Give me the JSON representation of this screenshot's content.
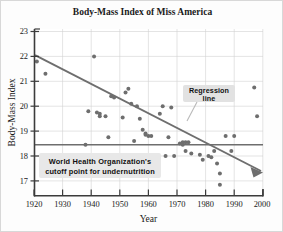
{
  "figure": {
    "title": "Body-Mass Index of Miss America",
    "border_color": "#d8d8d8",
    "background": "#fdfdfd"
  },
  "axes": {
    "x_label": "Year",
    "y_label": "Body-Mass Index",
    "x_ticks": [
      "1920",
      "1930",
      "1940",
      "1950",
      "1960",
      "1970",
      "1980",
      "1990",
      "2000"
    ],
    "y_ticks": [
      "17",
      "18",
      "19",
      "20",
      "21",
      "22",
      "23"
    ],
    "axis_color": "#3c3c3c",
    "grid_color": "#cfcfcf"
  },
  "annotations": {
    "regression": {
      "line1": "Regression",
      "line2": "line",
      "box_color": "#e2e2e2"
    },
    "who": {
      "line1": "World Health Organization's",
      "line2": "cutoff point for undernutrition",
      "box_color": "#e8e8e8"
    }
  },
  "chart_data": {
    "type": "scatter",
    "title": "Body-Mass Index of Miss America",
    "xlabel": "Year",
    "ylabel": "Body-Mass Index",
    "xlim": [
      1920,
      2000
    ],
    "ylim": [
      16.4,
      23
    ],
    "grid": true,
    "legend": false,
    "point_color": "#6e6e6e",
    "point_radius": 2.0,
    "series": [
      {
        "name": "Miss America BMI",
        "points": [
          [
            1921,
            21.8
          ],
          [
            1924,
            21.3
          ],
          [
            1939,
            19.8
          ],
          [
            1938,
            18.45
          ],
          [
            1941,
            22.0
          ],
          [
            1942,
            19.75
          ],
          [
            1943,
            19.7
          ],
          [
            1943,
            19.6
          ],
          [
            1945,
            19.6
          ],
          [
            1946,
            18.75
          ],
          [
            1947,
            20.4
          ],
          [
            1948,
            20.35
          ],
          [
            1951,
            19.55
          ],
          [
            1952,
            20.55
          ],
          [
            1953,
            20.7
          ],
          [
            1954,
            20.1
          ],
          [
            1955,
            18.6
          ],
          [
            1956,
            20.0
          ],
          [
            1957,
            19.5
          ],
          [
            1958,
            19.05
          ],
          [
            1959,
            18.9
          ],
          [
            1959,
            18.85
          ],
          [
            1960,
            18.8
          ],
          [
            1961,
            18.8
          ],
          [
            1964,
            19.7
          ],
          [
            1965,
            20.0
          ],
          [
            1966,
            18.0
          ],
          [
            1967,
            18.75
          ],
          [
            1968,
            19.95
          ],
          [
            1969,
            18.0
          ],
          [
            1971,
            18.5
          ],
          [
            1972,
            18.45
          ],
          [
            1972,
            18.55
          ],
          [
            1973,
            18.55
          ],
          [
            1973,
            18.2
          ],
          [
            1974,
            18.55
          ],
          [
            1975,
            18.1
          ],
          [
            1978,
            18.05
          ],
          [
            1979,
            17.85
          ],
          [
            1981,
            18.0
          ],
          [
            1982,
            17.95
          ],
          [
            1983,
            18.2
          ],
          [
            1984,
            17.7
          ],
          [
            1985,
            17.3
          ],
          [
            1985,
            16.85
          ],
          [
            1987,
            18.8
          ],
          [
            1989,
            18.2
          ],
          [
            1990,
            18.8
          ],
          [
            1997,
            20.75
          ],
          [
            1998,
            19.6
          ]
        ]
      }
    ],
    "reference_lines": [
      {
        "name": "who-cutoff",
        "orientation": "horizontal",
        "value": 18.55,
        "color": "#6e6e6e",
        "label": "World Health Organization's cutoff point for undernutrition"
      }
    ],
    "trend_line": {
      "name": "regression-line",
      "type": "linear",
      "x_start": 1920,
      "y_start": 21.85,
      "x_end": 2000,
      "y_end": 17.2,
      "slope": -0.0581,
      "color": "#6e6e6e",
      "arrow": true,
      "label": "Regression line"
    }
  }
}
